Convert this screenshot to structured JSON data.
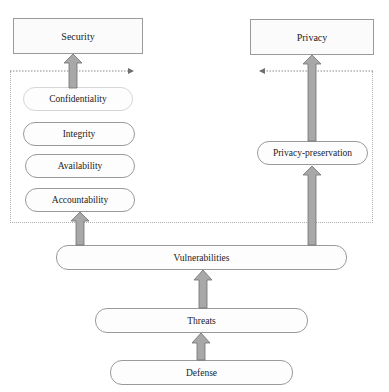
{
  "diagram": {
    "top_nodes": {
      "security": "Security",
      "privacy": "Privacy"
    },
    "security_attributes": [
      "Confidentiality",
      "Integrity",
      "Availability",
      "Accountability"
    ],
    "privacy_attributes": [
      "Privacy-preservation"
    ],
    "chain": {
      "vulnerabilities": "Vulnerabilities",
      "threats": "Threats",
      "defense": "Defense"
    },
    "edges": [
      {
        "from": "Defense",
        "to": "Threats"
      },
      {
        "from": "Threats",
        "to": "Vulnerabilities"
      },
      {
        "from": "Vulnerabilities",
        "to": "Accountability"
      },
      {
        "from": "Vulnerabilities",
        "to": "Privacy-preservation"
      },
      {
        "from": "Privacy-preservation",
        "to": "Privacy"
      },
      {
        "from": "Confidentiality",
        "to": "Security"
      }
    ],
    "colors": {
      "arrow_fill": "#a8a8a8",
      "arrow_stroke": "#6f6f6f",
      "border": "#9a9a9a",
      "dotted": "#b0b0b0"
    }
  }
}
